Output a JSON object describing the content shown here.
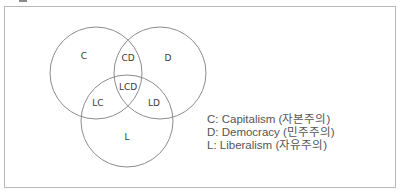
{
  "diagram": {
    "type": "venn",
    "sets": [
      {
        "id": "C",
        "label": "C",
        "cx": 96,
        "cy": 73,
        "r": 46
      },
      {
        "id": "D",
        "label": "D",
        "cx": 160,
        "cy": 73,
        "r": 46
      },
      {
        "id": "L",
        "label": "L",
        "cx": 127,
        "cy": 121,
        "r": 46
      }
    ],
    "regions": [
      {
        "id": "C",
        "label": "C",
        "x": 84,
        "y": 59
      },
      {
        "id": "CD",
        "label": "CD",
        "x": 128,
        "y": 61
      },
      {
        "id": "D",
        "label": "D",
        "x": 168,
        "y": 61
      },
      {
        "id": "LCD",
        "label": "LCD",
        "x": 128,
        "y": 90
      },
      {
        "id": "LC",
        "label": "LC",
        "x": 98,
        "y": 106
      },
      {
        "id": "LD",
        "label": "LD",
        "x": 154,
        "y": 106
      },
      {
        "id": "L",
        "label": "L",
        "x": 127,
        "y": 140
      }
    ],
    "stroke_color": "#8c8c8c"
  },
  "legend": {
    "items": [
      {
        "key": "C",
        "text": "C: Capitalism (자본주의)"
      },
      {
        "key": "D",
        "text": "D: Democracy (민주주의)"
      },
      {
        "key": "L",
        "text": "L: Liberalism (자유주의)"
      }
    ]
  }
}
